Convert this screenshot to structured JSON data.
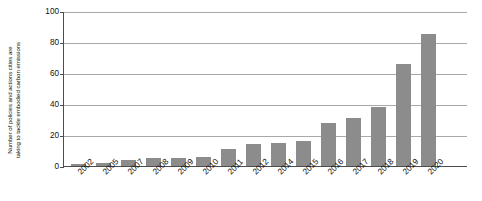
{
  "chart_data": {
    "type": "bar",
    "title": "",
    "xlabel": "",
    "ylabel_line1": "Number of policies and actions cities are",
    "ylabel_line2": "taking to tackle embodied carbon emissions",
    "categories": [
      "2002",
      "2005",
      "2007",
      "2008",
      "2009",
      "2010",
      "2011",
      "2012",
      "2014",
      "2015",
      "2016",
      "2017",
      "2018",
      "2019",
      "2020"
    ],
    "values": [
      1,
      2,
      4,
      5,
      5,
      6,
      11,
      14,
      15,
      16,
      28,
      31,
      38,
      66,
      85
    ],
    "ylim": [
      0,
      100
    ],
    "yticks": [
      0,
      20,
      40,
      60,
      80,
      100
    ],
    "ytick_labels": [
      "0",
      "20",
      "40",
      "60",
      "80",
      "100"
    ],
    "grid": "horizontal",
    "legend": "none",
    "bar_color": "#8c8c8c",
    "gridline_color": "#a9a9a9",
    "axis_color": "#4d4d4d",
    "background": "#ffffff"
  }
}
